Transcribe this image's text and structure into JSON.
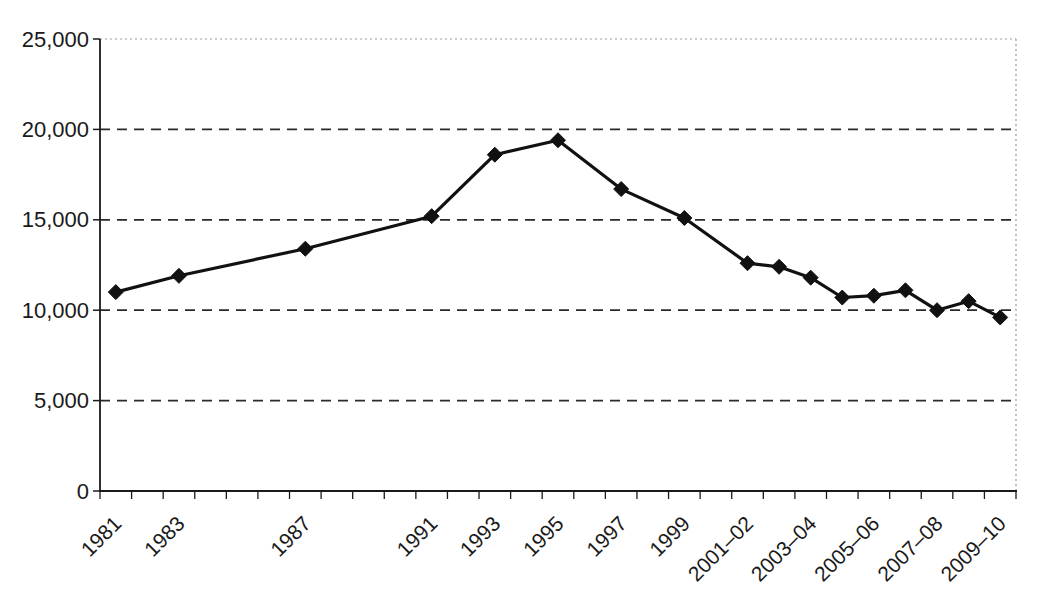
{
  "chart_data": {
    "type": "line",
    "title": "",
    "legend": "none",
    "grid": "horizontal-dashed",
    "background_color": "#ffffff",
    "line_color": "#111111",
    "marker": "diamond",
    "marker_color": "#111111",
    "frame_color": "#999999",
    "y_axis": {
      "min": 0,
      "max": 25000,
      "tick_interval": 5000,
      "ticks": [
        {
          "value": 0,
          "label": "0"
        },
        {
          "value": 5000,
          "label": "5,000"
        },
        {
          "value": 10000,
          "label": "10,000"
        },
        {
          "value": 15000,
          "label": "15,000"
        },
        {
          "value": 20000,
          "label": "20,000"
        },
        {
          "value": 25000,
          "label": "25,000"
        }
      ],
      "gridline_values": [
        5000,
        10000,
        15000,
        20000
      ]
    },
    "x_axis": {
      "slot_count": 29,
      "tick_marks": "every-slot-boundary",
      "label_rotation_deg": -45,
      "labels": [
        {
          "label": "1981",
          "slot": 0
        },
        {
          "label": "1983",
          "slot": 2
        },
        {
          "label": "1987",
          "slot": 6
        },
        {
          "label": "1991",
          "slot": 10
        },
        {
          "label": "1993",
          "slot": 12
        },
        {
          "label": "1995",
          "slot": 14
        },
        {
          "label": "1997",
          "slot": 16
        },
        {
          "label": "1999",
          "slot": 18
        },
        {
          "label": "2001–02",
          "slot": 20
        },
        {
          "label": "2003–04",
          "slot": 22
        },
        {
          "label": "2005–06",
          "slot": 24
        },
        {
          "label": "2007–08",
          "slot": 26
        },
        {
          "label": "2009–10",
          "slot": 28
        }
      ]
    },
    "series": [
      {
        "name": "series-1",
        "points": [
          {
            "category": "1981",
            "slot": 0,
            "value": 11000
          },
          {
            "category": "1983",
            "slot": 2,
            "value": 11900
          },
          {
            "category": "1987",
            "slot": 6,
            "value": 13400
          },
          {
            "category": "1991",
            "slot": 10,
            "value": 15200
          },
          {
            "category": "1993",
            "slot": 12,
            "value": 18600
          },
          {
            "category": "1995",
            "slot": 14,
            "value": 19400
          },
          {
            "category": "1997",
            "slot": 16,
            "value": 16700
          },
          {
            "category": "1999",
            "slot": 18,
            "value": 15100
          },
          {
            "category": "2001–02",
            "slot": 20,
            "value": 12600
          },
          {
            "category": "2002–03",
            "slot": 21,
            "value": 12400
          },
          {
            "category": "2003–04",
            "slot": 22,
            "value": 11800
          },
          {
            "category": "2004–05",
            "slot": 23,
            "value": 10700
          },
          {
            "category": "2005–06",
            "slot": 24,
            "value": 10800
          },
          {
            "category": "2006–07",
            "slot": 25,
            "value": 11100
          },
          {
            "category": "2007–08",
            "slot": 26,
            "value": 10000
          },
          {
            "category": "2008–09",
            "slot": 27,
            "value": 10500
          },
          {
            "category": "2009–10",
            "slot": 28,
            "value": 9600
          }
        ]
      }
    ]
  }
}
